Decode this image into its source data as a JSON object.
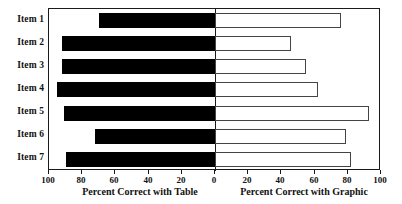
{
  "chart_data": {
    "type": "bar",
    "orientation": "horizontal",
    "style": "bidirectional-tornado",
    "title": "",
    "subtitle": "",
    "categories": [
      "Item 1",
      "Item 2",
      "Item 3",
      "Item 4",
      "Item 5",
      "Item 6",
      "Item 7"
    ],
    "series": [
      {
        "name": "Percent Correct with Table",
        "direction": "left",
        "fill": "#000000",
        "values": [
          70,
          92,
          92,
          95,
          91,
          72,
          90
        ]
      },
      {
        "name": "Percent Correct with Graphic",
        "direction": "right",
        "fill": "#ffffff",
        "values": [
          76,
          46,
          55,
          62,
          93,
          79,
          82
        ]
      }
    ],
    "xlabel_left": "Percent Correct with Table",
    "xlabel_right": "Percent Correct with Graphic",
    "ylabel": "",
    "xlim_left": [
      0,
      100
    ],
    "xlim_right": [
      0,
      100
    ],
    "xticks_left": [
      100,
      80,
      60,
      40,
      20,
      0
    ],
    "xticks_right": [
      0,
      20,
      40,
      60,
      80,
      100
    ],
    "grid": false,
    "legend": "none"
  },
  "axes": {
    "left_title": "Percent Correct with Table",
    "right_title": "Percent Correct with Graphic",
    "tick_labels": [
      "100",
      "80",
      "60",
      "40",
      "20",
      "0",
      "20",
      "40",
      "60",
      "80",
      "100"
    ]
  },
  "colors": {
    "table_bar": "#000000",
    "graphic_bar": "#ffffff",
    "frame": "#1a1a1a",
    "text": "#111111",
    "background": "#ffffff"
  }
}
